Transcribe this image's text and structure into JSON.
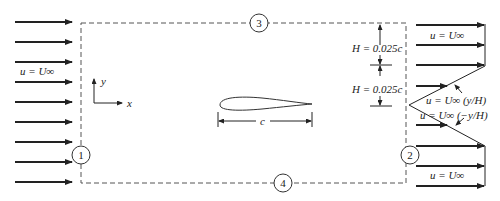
{
  "figure": {
    "type": "CFD control-volume boundary conditions around an airfoil",
    "colors": {
      "ink": "#222222",
      "dash": "#555555",
      "background": "#ffffff"
    }
  },
  "inlet": {
    "label": "u = U∞",
    "arrow_count": 9
  },
  "axes": {
    "x_label": "x",
    "y_label": "y"
  },
  "airfoil": {
    "chord_label": "c"
  },
  "boundaries": [
    {
      "id": "1",
      "side": "left"
    },
    {
      "id": "2",
      "side": "right"
    },
    {
      "id": "3",
      "side": "top"
    },
    {
      "id": "4",
      "side": "bottom"
    }
  ],
  "dimensions": {
    "upper_H": "H = 0.025c",
    "lower_H": "H = 0.025c"
  },
  "outlet": {
    "top_label": "u = U∞",
    "bottom_label": "u = U∞",
    "upper_shear_label": "u = U∞ (y/H)",
    "lower_shear_label": "u = U∞ (−y/H)"
  }
}
